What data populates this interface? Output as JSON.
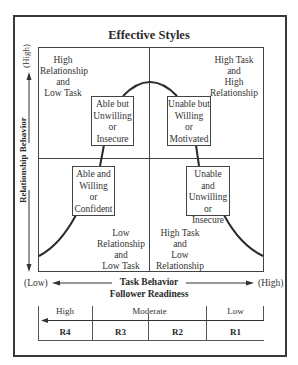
{
  "title": "Effective Styles",
  "axes": {
    "y_label": "Relationship Behavior",
    "y_high": "(High)",
    "y_low": "(Low)",
    "x_label": "Task Behavior",
    "x_sublabel": "Follower Readiness",
    "x_low": "(Low)",
    "x_high": "(High)"
  },
  "quadrants": [
    {
      "position": "top-left",
      "lines": [
        "High",
        "Relationship",
        "and",
        "Low Task"
      ]
    },
    {
      "position": "top-right",
      "lines": [
        "High Task",
        "and",
        "High",
        "Relationship"
      ]
    },
    {
      "position": "bottom-left",
      "lines": [
        "Low",
        "Relationship",
        "and",
        "Low Task"
      ]
    },
    {
      "position": "bottom-right",
      "lines": [
        "High Task",
        "and",
        "Low",
        "Relationship"
      ]
    }
  ],
  "style_boxes": [
    {
      "position": "upper-left",
      "lines": [
        "Able but",
        "Unwilling",
        "or",
        "Insecure"
      ]
    },
    {
      "position": "upper-right",
      "lines": [
        "Unable but",
        "Willing",
        "or",
        "Motivated"
      ]
    },
    {
      "position": "lower-left",
      "lines": [
        "Able and",
        "Willing",
        "or",
        "Confident"
      ]
    },
    {
      "position": "lower-right",
      "lines": [
        "Unable and",
        "Unwilling",
        "or",
        "Insecure"
      ]
    }
  ],
  "readiness": {
    "levels": [
      "High",
      "Moderate",
      "Low"
    ],
    "stages": [
      "R4",
      "R3",
      "R2",
      "R1"
    ]
  }
}
